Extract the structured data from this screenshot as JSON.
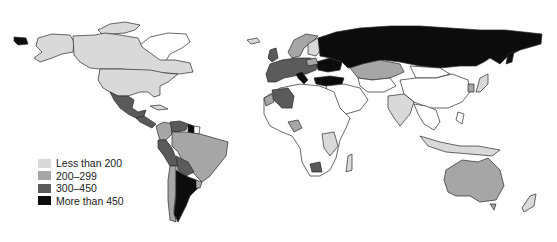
{
  "map": {
    "type": "choropleth",
    "region": "World",
    "legend": [
      {
        "label": "Less than 200",
        "color": "#d9d9d9"
      },
      {
        "label": "200–299",
        "color": "#a6a6a6"
      },
      {
        "label": "300–450",
        "color": "#5a5a5a"
      },
      {
        "label": "More than 450",
        "color": "#0c0c0c"
      }
    ],
    "no_data_color": "#ffffff",
    "classified_regions": {
      "less_than_200": [
        "Canada",
        "United States",
        "Greenland",
        "India",
        "Kenya",
        "Tanzania",
        "Madagascar",
        "Papua New Guinea",
        "Indonesia (part)",
        "Japan",
        "New Zealand",
        "Cuba",
        "Norway",
        "Sweden"
      ],
      "200_299": [
        "Brazil",
        "Kazakhstan",
        "Australia",
        "Nigeria",
        "Western Sahara",
        "Colombia",
        "Finland"
      ],
      "300_450": [
        "Mexico",
        "Central America",
        "Peru",
        "Bolivia",
        "Algeria",
        "Botswana",
        "France",
        "Spain",
        "Germany",
        "Thailand",
        "Venezuela"
      ],
      "more_than_450": [
        "Russia",
        "Argentina",
        "Ukraine",
        "Turkey",
        "Italy",
        "Guyana"
      ]
    }
  }
}
